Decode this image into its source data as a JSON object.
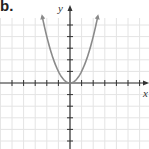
{
  "panel_label": "b.",
  "chart_data": {
    "type": "line",
    "title": "",
    "function": "y = x^2",
    "xlabel": "x",
    "ylabel": "y",
    "xlim": [
      -6,
      6.8
    ],
    "ylim": [
      -5.7,
      7
    ],
    "grid": true,
    "tick_step": 1,
    "series": [
      {
        "name": "parabola",
        "x": [
          -2.4,
          -2,
          -1.5,
          -1,
          -0.5,
          0,
          0.5,
          1,
          1.5,
          2,
          2.4
        ],
        "values": [
          5.76,
          4,
          2.25,
          1,
          0.25,
          0,
          0.25,
          1,
          2.25,
          4,
          5.76
        ],
        "arrows_at_ends": true
      }
    ]
  },
  "colors": {
    "grid": "#e4e4e4",
    "axis": "#333333",
    "curve": "#8a8a8a"
  }
}
